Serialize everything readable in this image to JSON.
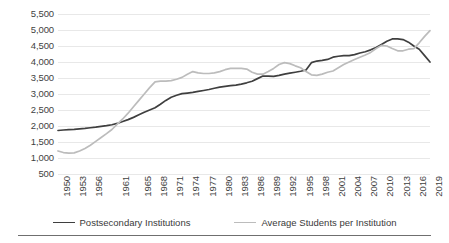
{
  "chart_data": {
    "type": "line",
    "title": "",
    "subtitle": "",
    "xlabel": "",
    "ylabel": "",
    "grid": true,
    "legend_position": "bottom",
    "ylim": [
      500,
      5500
    ],
    "y_ticks": [
      "500",
      "1,000",
      "1,500",
      "2,000",
      "2,500",
      "3,000",
      "3,500",
      "4,000",
      "4,500",
      "5,000",
      "5,500"
    ],
    "y_tick_values": [
      500,
      1000,
      1500,
      2000,
      2500,
      3000,
      3500,
      4000,
      4500,
      5000,
      5500
    ],
    "xlim": [
      1950,
      2019
    ],
    "x_tick_labels": [
      "1950",
      "1953",
      "1956",
      "1961",
      "1965",
      "1968",
      "1971",
      "1974",
      "1977",
      "1980",
      "1983",
      "1986",
      "1989",
      "1992",
      "1995",
      "1998",
      "2001",
      "2004",
      "2007",
      "2010",
      "2013",
      "2016",
      "2019"
    ],
    "x_tick_values": [
      1950,
      1953,
      1956,
      1961,
      1965,
      1968,
      1971,
      1974,
      1977,
      1980,
      1983,
      1986,
      1989,
      1992,
      1995,
      1998,
      2001,
      2004,
      2007,
      2010,
      2013,
      2016,
      2019
    ],
    "x": [
      1950,
      1951,
      1952,
      1953,
      1954,
      1955,
      1956,
      1957,
      1958,
      1959,
      1960,
      1961,
      1962,
      1963,
      1964,
      1965,
      1966,
      1967,
      1968,
      1969,
      1970,
      1971,
      1972,
      1973,
      1974,
      1975,
      1976,
      1977,
      1978,
      1979,
      1980,
      1981,
      1982,
      1983,
      1984,
      1985,
      1986,
      1987,
      1988,
      1989,
      1990,
      1991,
      1992,
      1993,
      1994,
      1995,
      1996,
      1997,
      1998,
      1999,
      2000,
      2001,
      2002,
      2003,
      2004,
      2005,
      2006,
      2007,
      2008,
      2009,
      2010,
      2011,
      2012,
      2013,
      2014,
      2015,
      2016,
      2017,
      2018,
      2019
    ],
    "series": [
      {
        "name": "Postsecondary Institutions",
        "color": "#3f3f3f",
        "values": [
          1860,
          1875,
          1885,
          1895,
          1910,
          1925,
          1945,
          1965,
          1990,
          2010,
          2040,
          2080,
          2140,
          2200,
          2270,
          2350,
          2430,
          2500,
          2570,
          2680,
          2800,
          2900,
          2960,
          3010,
          3030,
          3050,
          3080,
          3110,
          3140,
          3180,
          3215,
          3240,
          3260,
          3280,
          3310,
          3350,
          3400,
          3480,
          3560,
          3560,
          3550,
          3580,
          3620,
          3650,
          3680,
          3710,
          3750,
          3980,
          4030,
          4050,
          4080,
          4150,
          4180,
          4200,
          4200,
          4230,
          4280,
          4320,
          4380,
          4450,
          4550,
          4650,
          4720,
          4720,
          4700,
          4620,
          4500,
          4400,
          4200,
          4000
        ]
      },
      {
        "name": "Average Students per Institution",
        "color": "#bcbcbc",
        "values": [
          1220,
          1170,
          1150,
          1160,
          1220,
          1300,
          1400,
          1520,
          1640,
          1760,
          1890,
          2060,
          2220,
          2400,
          2600,
          2800,
          3000,
          3200,
          3380,
          3400,
          3400,
          3420,
          3460,
          3520,
          3620,
          3700,
          3660,
          3640,
          3640,
          3660,
          3700,
          3760,
          3800,
          3800,
          3800,
          3780,
          3680,
          3620,
          3620,
          3700,
          3800,
          3920,
          3980,
          3950,
          3880,
          3820,
          3700,
          3600,
          3580,
          3620,
          3680,
          3720,
          3820,
          3920,
          4000,
          4080,
          4150,
          4220,
          4300,
          4420,
          4520,
          4500,
          4420,
          4350,
          4350,
          4400,
          4420,
          4600,
          4800,
          4980
        ]
      }
    ]
  },
  "legend": {
    "items": [
      {
        "label": "Postsecondary Institutions",
        "color": "#3f3f3f"
      },
      {
        "label": "Average Students per Institution",
        "color": "#bcbcbc"
      }
    ]
  }
}
